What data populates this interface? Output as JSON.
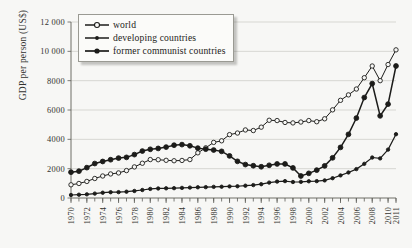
{
  "chart_data": {
    "type": "line",
    "title": "",
    "xlabel": "",
    "ylabel": "GDP per person (US$)",
    "xlim": [
      1970,
      2011
    ],
    "ylim": [
      0,
      12000
    ],
    "yticks": [
      0,
      2000,
      4000,
      6000,
      8000,
      10000,
      12000
    ],
    "ytick_labels": [
      "0",
      "2000",
      "4000",
      "6000",
      "8000",
      "10 000",
      "12 000"
    ],
    "xticks": [
      1970,
      1972,
      1974,
      1976,
      1978,
      1980,
      1982,
      1984,
      1986,
      1988,
      1990,
      1992,
      1994,
      1996,
      1998,
      2000,
      2002,
      2004,
      2006,
      2008,
      2010,
      2011
    ],
    "xtick_labels": [
      "1970",
      "1972",
      "1974",
      "1976",
      "1978",
      "1980",
      "1982",
      "1984",
      "1986",
      "1988",
      "1990",
      "1992",
      "1994",
      "1996",
      "1998",
      "2000",
      "2002",
      "2004",
      "2006",
      "2008",
      "2010",
      "2011"
    ],
    "x": [
      1970,
      1971,
      1972,
      1973,
      1974,
      1975,
      1976,
      1977,
      1978,
      1979,
      1980,
      1981,
      1982,
      1983,
      1984,
      1985,
      1986,
      1987,
      1988,
      1989,
      1990,
      1991,
      1992,
      1993,
      1994,
      1995,
      1996,
      1997,
      1998,
      1999,
      2000,
      2001,
      2002,
      2003,
      2004,
      2005,
      2006,
      2007,
      2008,
      2009,
      2010,
      2011
    ],
    "grid": true,
    "legend_position": "top-left",
    "series": [
      {
        "name": "world",
        "marker": "open-circle",
        "values": [
          900,
          990,
          1130,
          1330,
          1500,
          1640,
          1710,
          1870,
          2120,
          2370,
          2620,
          2610,
          2570,
          2540,
          2560,
          2620,
          3080,
          3420,
          3790,
          3900,
          4320,
          4430,
          4640,
          4600,
          4830,
          5300,
          5280,
          5150,
          5120,
          5180,
          5280,
          5200,
          5400,
          6010,
          6660,
          7030,
          7430,
          8200,
          9000,
          8000,
          9100,
          10100
        ]
      },
      {
        "name": "developing countries",
        "marker": "small-filled-circle",
        "values": [
          205,
          225,
          250,
          300,
          360,
          395,
          400,
          430,
          480,
          545,
          620,
          650,
          660,
          670,
          690,
          710,
          730,
          740,
          760,
          770,
          790,
          800,
          840,
          880,
          940,
          1050,
          1120,
          1150,
          1090,
          1100,
          1140,
          1150,
          1200,
          1350,
          1540,
          1740,
          1970,
          2330,
          2760,
          2700,
          3300,
          4350
        ]
      },
      {
        "name": "former communist countries",
        "marker": "filled-circle",
        "values": [
          1760,
          1830,
          2070,
          2350,
          2490,
          2610,
          2720,
          2770,
          2960,
          3200,
          3320,
          3380,
          3470,
          3600,
          3640,
          3560,
          3400,
          3330,
          3270,
          3180,
          2870,
          2500,
          2280,
          2200,
          2130,
          2230,
          2320,
          2320,
          2050,
          1500,
          1680,
          1900,
          2190,
          2740,
          3450,
          4340,
          5450,
          6850,
          7800,
          5600,
          6400,
          9000
        ]
      }
    ]
  },
  "legend": {
    "items": [
      {
        "label": "world",
        "marker": "open-circle"
      },
      {
        "label": "developing countries",
        "marker": "small-filled-circle"
      },
      {
        "label": "former communist countries",
        "marker": "filled-circle"
      }
    ]
  },
  "axis": {
    "y_title": "GDP per person (US$)"
  }
}
